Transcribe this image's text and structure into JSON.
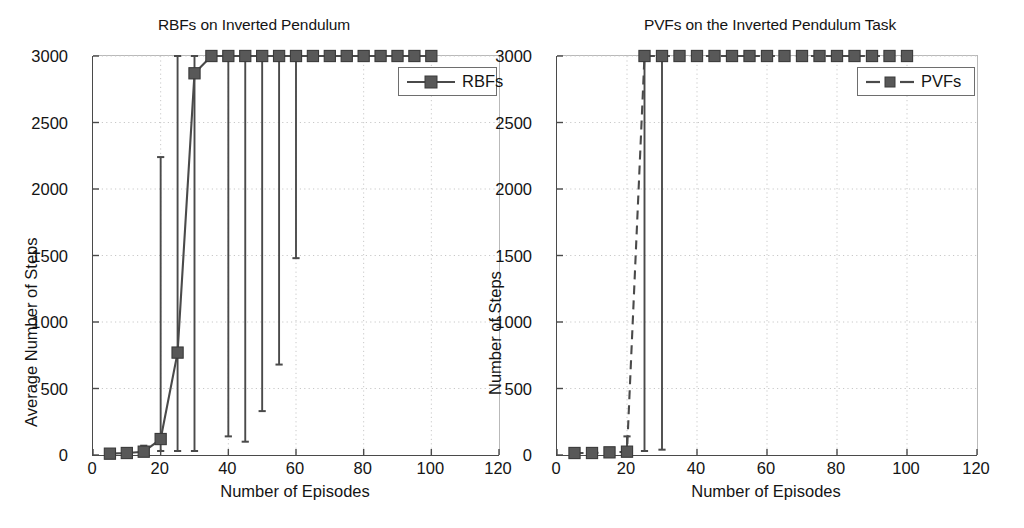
{
  "page": {
    "width": 1024,
    "height": 528,
    "background": "#ffffff",
    "line_color": "#4a4a4a",
    "marker_color": "#585858",
    "grid_color": "#c8c8c8",
    "text_color": "#141414"
  },
  "charts": [
    {
      "id": "rbf-chart",
      "title": "RBFs on Inverted Pendulum",
      "xlabel": "Number of Episodes",
      "ylabel": "Average Number of Steps",
      "legend_label": "RBFs",
      "legend_style": "solid",
      "xticks": [
        0,
        20,
        40,
        60,
        80,
        100,
        120
      ],
      "yticks": [
        0,
        500,
        1000,
        1500,
        2000,
        2500,
        3000
      ],
      "xlim": [
        0,
        120
      ],
      "ylim": [
        0,
        3000
      ],
      "grid": true
    },
    {
      "id": "pvf-chart",
      "title": "PVFs on the Inverted Pendulum Task",
      "xlabel": "Number of Episodes",
      "ylabel": "Number of Steps",
      "legend_label": "PVFs",
      "legend_style": "dashed",
      "xticks": [
        0,
        20,
        40,
        60,
        80,
        100,
        120
      ],
      "yticks": [
        0,
        500,
        1000,
        1500,
        2000,
        2500,
        3000
      ],
      "xlim": [
        0,
        120
      ],
      "ylim": [
        0,
        3000
      ],
      "grid": true
    }
  ],
  "chart_data": [
    {
      "type": "line",
      "id": "rbf-chart",
      "title": "RBFs on Inverted Pendulum",
      "xlabel": "Number of Episodes",
      "ylabel": "Average Number of Steps",
      "xlim": [
        0,
        120
      ],
      "ylim": [
        0,
        3000
      ],
      "xticks": [
        0,
        20,
        40,
        60,
        80,
        100,
        120
      ],
      "yticks": [
        0,
        500,
        1000,
        1500,
        2000,
        2500,
        3000
      ],
      "grid": true,
      "legend": [
        "RBFs"
      ],
      "legend_position": "upper-right",
      "series": [
        {
          "name": "RBFs",
          "style": "solid",
          "marker": "square",
          "x": [
            5,
            10,
            15,
            20,
            25,
            30,
            35,
            40,
            45,
            50,
            55,
            60,
            65,
            70,
            75,
            80,
            85,
            90,
            95,
            100
          ],
          "y": [
            10,
            15,
            25,
            120,
            770,
            2870,
            3000,
            3000,
            3000,
            3000,
            3000,
            3000,
            3000,
            3000,
            3000,
            3000,
            3000,
            3000,
            3000,
            3000
          ],
          "err_low": [
            10,
            15,
            25,
            30,
            30,
            30,
            3000,
            140,
            100,
            330,
            680,
            1480,
            3000,
            3000,
            3000,
            3000,
            3000,
            3000,
            3000,
            3000
          ],
          "err_high": [
            10,
            15,
            70,
            2240,
            3000,
            3000,
            3000,
            3000,
            3000,
            3000,
            3000,
            3000,
            3000,
            3000,
            3000,
            3000,
            3000,
            3000,
            3000,
            3000
          ]
        }
      ]
    },
    {
      "type": "line",
      "id": "pvf-chart",
      "title": "PVFs on the Inverted Pendulum Task",
      "xlabel": "Number of Episodes",
      "ylabel": "Number of Steps",
      "xlim": [
        0,
        120
      ],
      "ylim": [
        0,
        3000
      ],
      "xticks": [
        0,
        20,
        40,
        60,
        80,
        100,
        120
      ],
      "yticks": [
        0,
        500,
        1000,
        1500,
        2000,
        2500,
        3000
      ],
      "grid": true,
      "legend": [
        "PVFs"
      ],
      "legend_position": "upper-right",
      "series": [
        {
          "name": "PVFs",
          "style": "dashed",
          "marker": "square",
          "x": [
            5,
            10,
            15,
            20,
            25,
            30,
            35,
            40,
            45,
            50,
            55,
            60,
            65,
            70,
            75,
            80,
            85,
            90,
            95,
            100
          ],
          "y": [
            15,
            15,
            20,
            25,
            3000,
            3000,
            3000,
            3000,
            3000,
            3000,
            3000,
            3000,
            3000,
            3000,
            3000,
            3000,
            3000,
            3000,
            3000,
            3000
          ],
          "err_low": [
            15,
            15,
            20,
            25,
            30,
            40,
            3000,
            3000,
            3000,
            3000,
            3000,
            3000,
            3000,
            3000,
            3000,
            3000,
            3000,
            3000,
            3000,
            3000
          ],
          "err_high": [
            15,
            15,
            20,
            140,
            3000,
            3000,
            3000,
            3000,
            3000,
            3000,
            3000,
            3000,
            3000,
            3000,
            3000,
            3000,
            3000,
            3000,
            3000,
            3000
          ]
        }
      ]
    }
  ]
}
